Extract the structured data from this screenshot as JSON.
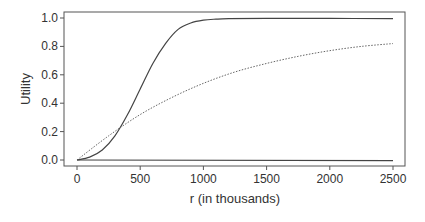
{
  "chart_data": {
    "type": "line",
    "title": "",
    "xlabel": "r (in thousands)",
    "ylabel": "Utility",
    "xlim": [
      0,
      2500
    ],
    "ylim": [
      0.0,
      1.0
    ],
    "grid": false,
    "legend": null,
    "x_ticks": [
      0,
      500,
      1000,
      1500,
      2000,
      2500
    ],
    "x_tick_labels": [
      "0",
      "500",
      "1000",
      "1500",
      "2000",
      "2500"
    ],
    "y_ticks": [
      0.0,
      0.2,
      0.4,
      0.6,
      0.8,
      1.0
    ],
    "y_tick_labels": [
      "0.0",
      "0.2",
      "0.4",
      "0.6",
      "0.8",
      "1.0"
    ],
    "series": [
      {
        "name": "solid-sigmoid",
        "style": "solid",
        "x": [
          0,
          100,
          200,
          300,
          400,
          500,
          600,
          700,
          800,
          900,
          1000,
          1100,
          1200,
          1500,
          2000,
          2500
        ],
        "values": [
          0.0,
          0.02,
          0.07,
          0.17,
          0.32,
          0.5,
          0.68,
          0.82,
          0.92,
          0.965,
          0.985,
          0.992,
          0.995,
          0.997,
          0.997,
          0.995
        ]
      },
      {
        "name": "dotted-concave",
        "style": "dotted",
        "x": [
          0,
          250,
          500,
          750,
          1000,
          1250,
          1500,
          1750,
          2000,
          2250,
          2500
        ],
        "values": [
          0.0,
          0.17,
          0.32,
          0.44,
          0.54,
          0.62,
          0.68,
          0.73,
          0.77,
          0.8,
          0.82
        ]
      },
      {
        "name": "solid-flat",
        "style": "solid",
        "x": [
          0,
          2500
        ],
        "values": [
          0.0,
          -0.005
        ]
      }
    ]
  }
}
